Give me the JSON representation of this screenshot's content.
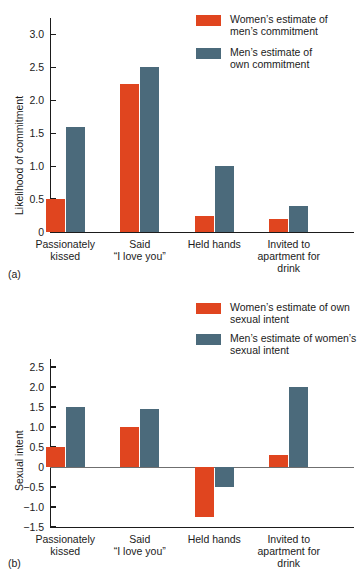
{
  "figure": {
    "panels": [
      {
        "caption": "(a)",
        "ylabel": "Likelihood of commitment",
        "yticks": [
          "0",
          "0.5",
          "1.0",
          "1.5",
          "2.0",
          "2.5",
          "3.0"
        ],
        "categories": [
          "Passionately\nkissed",
          "Said\n“I love you”",
          "Held hands",
          "Invited to\napartment for\ndrink"
        ],
        "legend": [
          {
            "key": "women",
            "label": "Women’s estimate of\nmen’s commitment",
            "color": "#e0451f"
          },
          {
            "key": "men",
            "label": "Men’s estimate of\nown commitment",
            "color": "#4b6a7b"
          }
        ]
      },
      {
        "caption": "(b)",
        "ylabel": "Sexual intent",
        "yticks": [
          "-1.5",
          "-1.0",
          "-0.5",
          "0",
          "0.5",
          "1.0",
          "1.5",
          "2.0",
          "2.5"
        ],
        "categories": [
          "Passionately\nkissed",
          "Said\n“I love you”",
          "Held hands",
          "Invited to\napartment for\ndrink"
        ],
        "legend": [
          {
            "key": "women",
            "label": "Women’s estimate of own\nsexual intent",
            "color": "#e0451f"
          },
          {
            "key": "men",
            "label": "Men’s estimate of women’s\nsexual intent",
            "color": "#4b6a7b"
          }
        ]
      }
    ]
  },
  "chart_data": [
    {
      "type": "bar",
      "panel": "(a)",
      "title": "",
      "xlabel": "",
      "ylabel": "Likelihood of commitment",
      "ylim": [
        0,
        3.25
      ],
      "yticks": [
        0,
        0.5,
        1.0,
        1.5,
        2.0,
        2.5,
        3.0
      ],
      "grid": false,
      "legend_position": "top-right",
      "categories": [
        "Passionately kissed",
        "Said “I love you”",
        "Held hands",
        "Invited to apartment for drink"
      ],
      "series": [
        {
          "name": "Women’s estimate of men’s commitment",
          "color": "#e0451f",
          "values": [
            0.5,
            2.25,
            0.25,
            0.2
          ]
        },
        {
          "name": "Men’s estimate of own commitment",
          "color": "#4b6a7b",
          "values": [
            1.6,
            2.5,
            1.0,
            0.4
          ]
        }
      ]
    },
    {
      "type": "bar",
      "panel": "(b)",
      "title": "",
      "xlabel": "",
      "ylabel": "Sexual intent",
      "ylim": [
        -1.5,
        2.7
      ],
      "yticks": [
        -1.5,
        -1.0,
        -0.5,
        0,
        0.5,
        1.0,
        1.5,
        2.0,
        2.5
      ],
      "grid": false,
      "legend_position": "top-right",
      "categories": [
        "Passionately kissed",
        "Said “I love you”",
        "Held hands",
        "Invited to apartment for drink"
      ],
      "series": [
        {
          "name": "Women’s estimate of own sexual intent",
          "color": "#e0451f",
          "values": [
            0.5,
            1.0,
            -1.25,
            0.3
          ]
        },
        {
          "name": "Men’s estimate of women’s sexual intent",
          "color": "#4b6a7b",
          "values": [
            1.5,
            1.45,
            -0.5,
            2.0
          ]
        }
      ]
    }
  ]
}
